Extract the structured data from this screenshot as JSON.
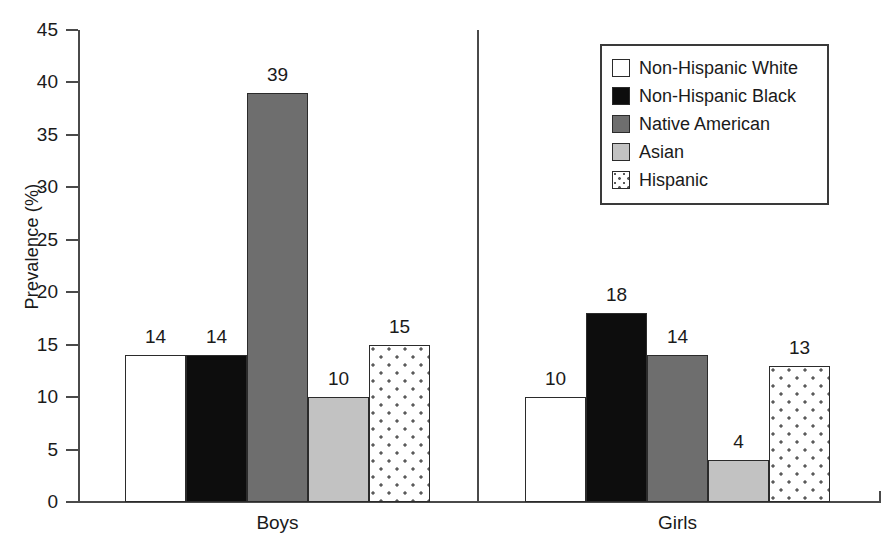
{
  "chart_data": {
    "type": "bar",
    "title": "",
    "subtitle": "",
    "xlabel": "",
    "ylabel": "Prevalence (%)",
    "ylim": [
      0,
      45
    ],
    "yticks": [
      0,
      5,
      10,
      15,
      20,
      25,
      30,
      35,
      40,
      45
    ],
    "ytick_labels": [
      "0",
      "5",
      "10",
      "15",
      "20",
      "25",
      "30",
      "35",
      "40",
      "45"
    ],
    "grid": false,
    "legend_position": "top-right",
    "categories": [
      "Boys",
      "Girls"
    ],
    "series": [
      {
        "name": "Non-Hispanic White",
        "values": [
          14,
          10
        ],
        "fill": "white",
        "color": "#ffffff"
      },
      {
        "name": "Non-Hispanic Black",
        "values": [
          14,
          18
        ],
        "fill": "black",
        "color": "#0d0d0d"
      },
      {
        "name": "Native American",
        "values": [
          39,
          14
        ],
        "fill": "dgray",
        "color": "#6e6e6e"
      },
      {
        "name": "Asian",
        "values": [
          10,
          4
        ],
        "fill": "lgray",
        "color": "#c2c2c2"
      },
      {
        "name": "Hispanic",
        "values": [
          15,
          13
        ],
        "fill": "dots",
        "color": "#ffffff"
      }
    ],
    "data_labels": {
      "Boys": [
        "14",
        "14",
        "39",
        "10",
        "15"
      ],
      "Girls": [
        "10",
        "18",
        "14",
        "4",
        "13"
      ]
    }
  },
  "legend": {
    "items": [
      {
        "label": "Non-Hispanic White",
        "fill": "white"
      },
      {
        "label": "Non-Hispanic Black",
        "fill": "black"
      },
      {
        "label": "Native American",
        "fill": "dgray"
      },
      {
        "label": "Asian",
        "fill": "lgray"
      },
      {
        "label": "Hispanic",
        "fill": "dots"
      }
    ]
  },
  "axes": {
    "y_title": "Prevalence (%)",
    "x_categories": [
      "Boys",
      "Girls"
    ]
  },
  "colors": {
    "axis": "#4a4a4a",
    "bar_outline": "#2b2b2b",
    "text": "#1a1a1a",
    "background": "#ffffff"
  }
}
